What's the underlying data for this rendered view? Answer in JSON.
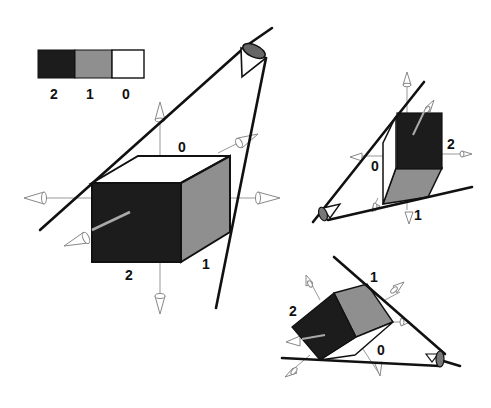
{
  "legend": {
    "swatches": [
      {
        "label": "2",
        "color": "#1c1c1c"
      },
      {
        "label": "1",
        "color": "#8f8f8f"
      },
      {
        "label": "0",
        "color": "#ffffff"
      }
    ]
  },
  "main_view": {
    "labels": {
      "top": "0",
      "right_bottom": "1",
      "front_bottom": "2"
    },
    "colors": {
      "front": "#1c1c1c",
      "side": "#8f8f8f",
      "top": "#ffffff"
    }
  },
  "view_right": {
    "labels": {
      "right": "2",
      "left": "0",
      "bottom": "1"
    }
  },
  "view_bottom": {
    "labels": {
      "left": "2",
      "top": "1",
      "right": "0"
    }
  }
}
